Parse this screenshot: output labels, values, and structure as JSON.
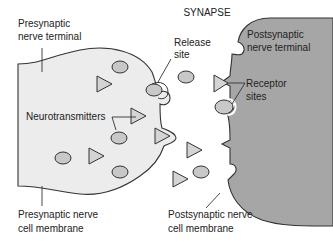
{
  "title": "SYNAPSE",
  "labels": {
    "presynaptic_terminal": [
      "Presynaptic",
      "nerve terminal"
    ],
    "release_site": [
      "Release",
      "site"
    ],
    "postsynaptic_terminal": [
      "Postsynaptic",
      "nerve terminal"
    ],
    "neurotransmitters": "Neurotransmitters",
    "receptor_sites": [
      "Receptor",
      "sites"
    ],
    "presynaptic_membrane": [
      "Presynaptic nerve",
      "cell membrane"
    ],
    "postsynaptic_membrane": [
      "Postsynaptic nerve",
      "cell membrane"
    ]
  },
  "colors": {
    "presynaptic_fill": "#ececec",
    "postsynaptic_fill": "#a6a6a6",
    "vesicle_fill": "#c8c8c8",
    "outline": "#333333"
  }
}
